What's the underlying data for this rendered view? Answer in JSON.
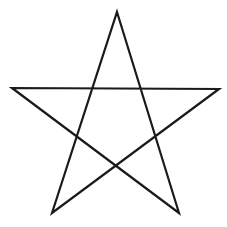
{
  "diagram": {
    "shape": "pentagram",
    "label": "",
    "stroke_color": "#1a1a1a",
    "background_color": "#ffffff",
    "stroke_width": 2.2,
    "vertices": [
      {
        "name": "top",
        "x": 117,
        "y": 12
      },
      {
        "name": "bottom-right",
        "x": 179,
        "y": 213
      },
      {
        "name": "left",
        "x": 12,
        "y": 88
      },
      {
        "name": "right",
        "x": 219,
        "y": 89
      },
      {
        "name": "bottom-left",
        "x": 52,
        "y": 213
      }
    ],
    "path_order": [
      "top",
      "bottom-right",
      "left",
      "right",
      "bottom-left",
      "top"
    ]
  }
}
